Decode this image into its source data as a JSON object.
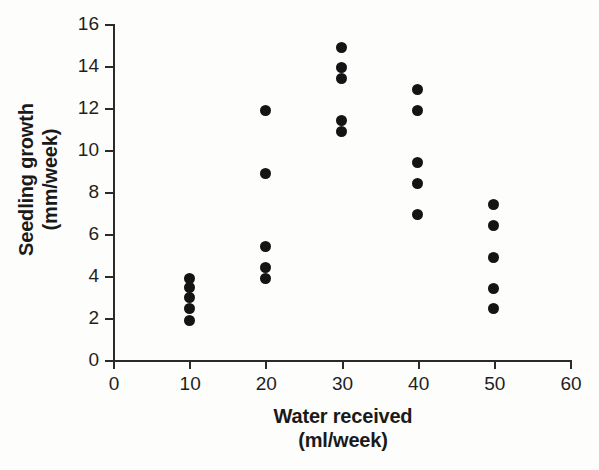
{
  "chart_data": {
    "type": "scatter",
    "title": "",
    "xlabel": "Water received (ml/week)",
    "xlabel_lines": [
      "Water received",
      "(ml/week)"
    ],
    "ylabel": "Seedling growth (mm/week)",
    "ylabel_lines": [
      "Seedling growth",
      "(mm/week)"
    ],
    "xlim": [
      0,
      60
    ],
    "ylim": [
      0,
      16
    ],
    "xticks": [
      0,
      10,
      20,
      30,
      40,
      50,
      60
    ],
    "xtick_labels": [
      "0",
      "10",
      "20",
      "30",
      "40",
      "50",
      "60"
    ],
    "yticks": [
      0,
      2,
      4,
      6,
      8,
      10,
      12,
      14,
      16
    ],
    "ytick_labels": [
      "0",
      "2",
      "4",
      "6",
      "8",
      "10",
      "12",
      "14",
      "16"
    ],
    "grid": false,
    "legend": false,
    "marker": "filled-circle",
    "marker_color": "#141414",
    "axis_color": "#2b2b2b",
    "background_color": "#fdfdfb",
    "series": [
      {
        "name": "Seedling growth",
        "points": [
          {
            "x": 10,
            "y": 3.9
          },
          {
            "x": 10,
            "y": 3.45
          },
          {
            "x": 10,
            "y": 3.0
          },
          {
            "x": 10,
            "y": 2.45
          },
          {
            "x": 10,
            "y": 1.9
          },
          {
            "x": 20,
            "y": 11.9
          },
          {
            "x": 20,
            "y": 8.9
          },
          {
            "x": 20,
            "y": 5.4
          },
          {
            "x": 20,
            "y": 4.4
          },
          {
            "x": 20,
            "y": 3.9
          },
          {
            "x": 30,
            "y": 14.9
          },
          {
            "x": 30,
            "y": 13.95
          },
          {
            "x": 30,
            "y": 13.4
          },
          {
            "x": 30,
            "y": 11.4
          },
          {
            "x": 30,
            "y": 10.9
          },
          {
            "x": 40,
            "y": 12.9
          },
          {
            "x": 40,
            "y": 11.9
          },
          {
            "x": 40,
            "y": 9.4
          },
          {
            "x": 40,
            "y": 8.4
          },
          {
            "x": 40,
            "y": 6.95
          },
          {
            "x": 50,
            "y": 7.4
          },
          {
            "x": 50,
            "y": 6.4
          },
          {
            "x": 50,
            "y": 4.9
          },
          {
            "x": 50,
            "y": 3.4
          },
          {
            "x": 50,
            "y": 2.45
          }
        ]
      }
    ]
  }
}
